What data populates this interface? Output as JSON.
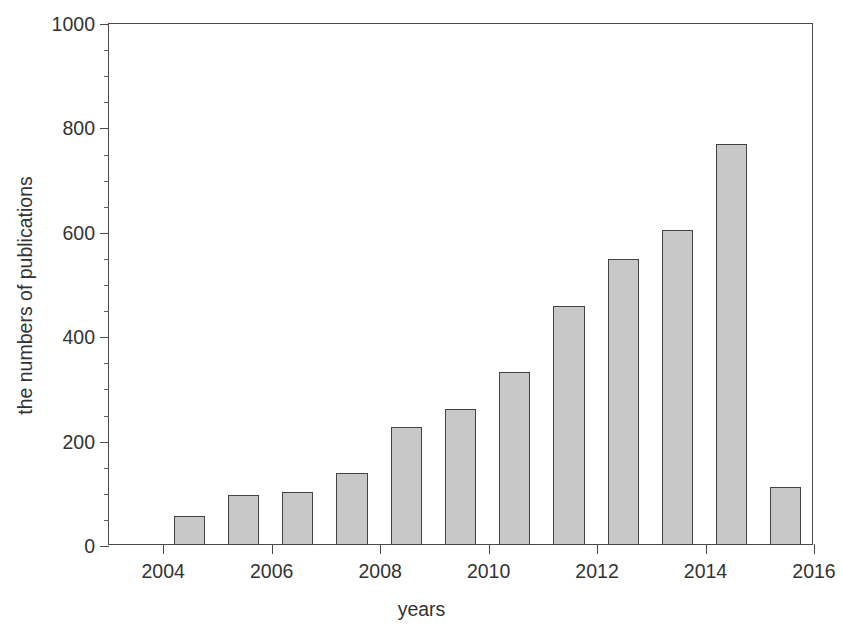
{
  "chart_data": {
    "type": "bar",
    "title": "the importance of electrospinning technology",
    "xlabel": "years",
    "ylabel": "the numbers of publications",
    "categories": [
      2004,
      2005,
      2006,
      2007,
      2008,
      2009,
      2010,
      2011,
      2012,
      2013,
      2014,
      2015
    ],
    "values": [
      55,
      95,
      102,
      138,
      226,
      261,
      332,
      458,
      547,
      604,
      768,
      111
    ],
    "xlim": [
      2003,
      2016
    ],
    "ylim": [
      0,
      1000
    ],
    "x_ticks": [
      2004,
      2006,
      2008,
      2010,
      2012,
      2014,
      2016
    ],
    "x_tick_labels": [
      "2004",
      "2006",
      "2008",
      "2010",
      "2012",
      "2014",
      "2016"
    ],
    "y_ticks": [
      0,
      200,
      400,
      600,
      800,
      1000
    ],
    "y_tick_labels": [
      "0",
      "200",
      "400",
      "600",
      "800",
      "1000"
    ],
    "y_minor_step": 50,
    "grid": false,
    "legend": false,
    "bar_fill_color": "#c8c8c8",
    "bar_edge_color": "#434343",
    "axis_color": "#4a4a4a",
    "background_color": "#ffffff",
    "bar_width_years": 0.575
  }
}
